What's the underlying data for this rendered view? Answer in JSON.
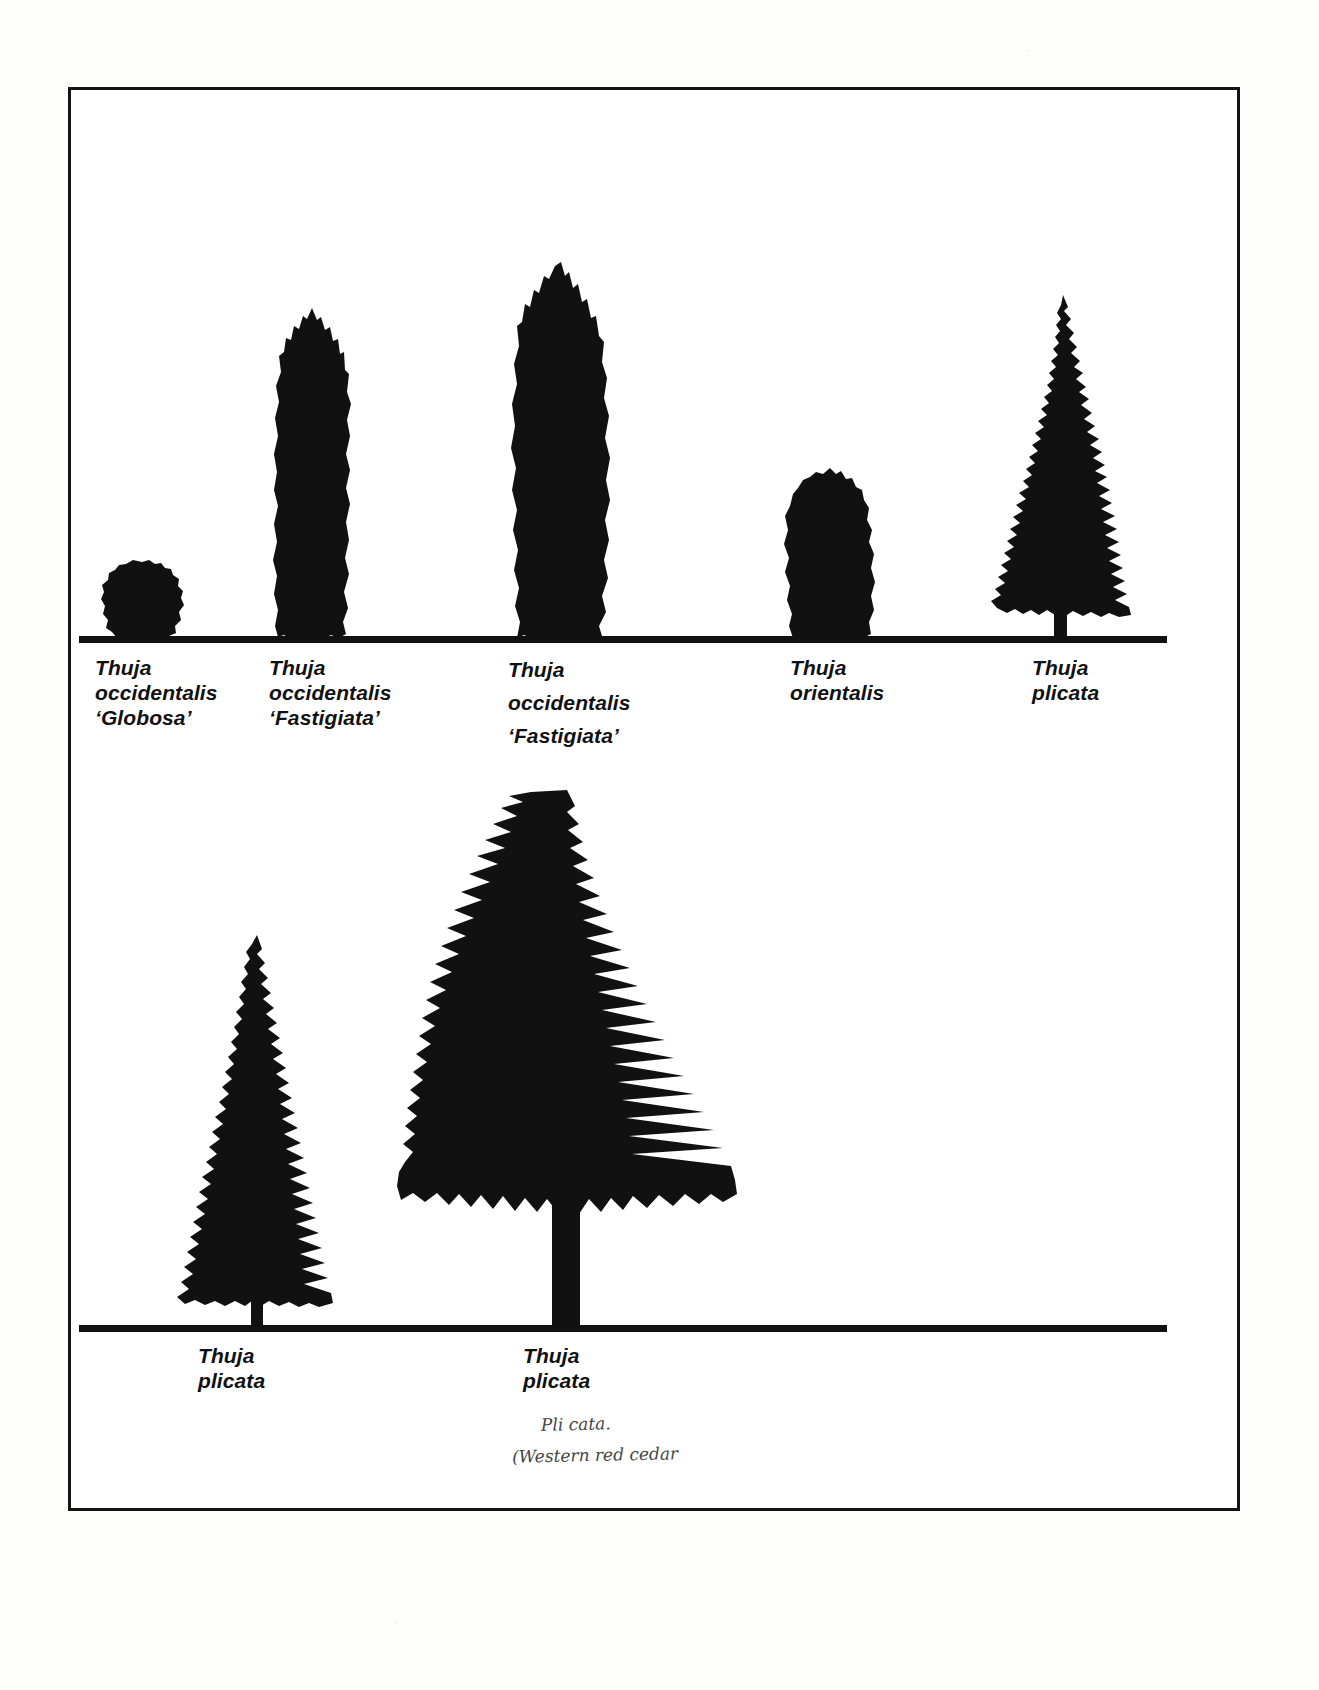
{
  "page": {
    "background_color": "#ffffff",
    "ink_color": "#111111",
    "frame": {
      "border_color": "#141414"
    }
  },
  "plates": [
    {
      "name": "upper-plate",
      "ground_line_label": "upper-ground-line",
      "specimens": [
        {
          "id": "thuja-occidentalis-globosa",
          "label": "Thuja\noccidentalis\n‘Globosa’",
          "form": "globe",
          "relative_height": 0.09
        },
        {
          "id": "thuja-occidentalis-fastigiata-small",
          "label": "Thuja\noccidentalis\n‘Fastigiata’",
          "form": "columnar",
          "relative_height": 0.4
        },
        {
          "id": "thuja-occidentalis-fastigiata-large",
          "label": "Thuja\noccidentalis\n‘Fastigiata’",
          "form": "columnar-tall",
          "relative_height": 0.48
        },
        {
          "id": "thuja-orientalis",
          "label": "Thuja\norientalis",
          "form": "ovoid",
          "relative_height": 0.2
        },
        {
          "id": "thuja-plicata-upper",
          "label": "Thuja\nplicata",
          "form": "conical",
          "relative_height": 0.42
        }
      ]
    },
    {
      "name": "lower-plate",
      "ground_line_label": "lower-ground-line",
      "specimens": [
        {
          "id": "thuja-plicata-narrow",
          "label": "Thuja\nplicata",
          "form": "narrow-conical",
          "relative_height": 0.52
        },
        {
          "id": "thuja-plicata-broad",
          "label": "Thuja\nplicata",
          "form": "broad-conical",
          "relative_height": 0.8
        }
      ]
    }
  ],
  "annotation": {
    "name": "handwritten-note",
    "line1": "Pli cata.",
    "line2": "(Western red cedar"
  }
}
